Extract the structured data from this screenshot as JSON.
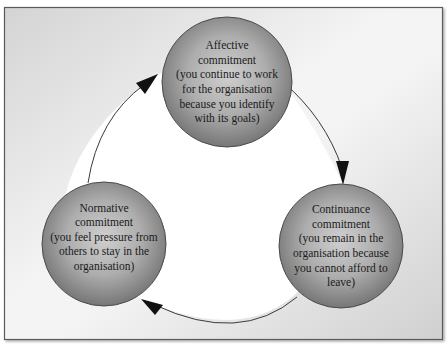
{
  "diagram": {
    "type": "cycle",
    "colors": {
      "frame_border": "#5a5a5a",
      "background_outer_light": "#ffffff",
      "background_outer_dark": "#d6d6d6",
      "inner_fill": "#ffffff",
      "circle_center": "#c4c4c4",
      "circle_edge": "#7c7c7c",
      "circle_outline": "#4a4a4a",
      "arrow": "#3a3a3a",
      "text": "#1a1a1a"
    },
    "nodes": [
      {
        "id": "affective",
        "title_line1": "Affective",
        "title_line2": "commitment",
        "desc_line1": "(you continue to work",
        "desc_line2": "for the organisation",
        "desc_line3": "because you identify",
        "desc_line4": "with its goals)"
      },
      {
        "id": "continuance",
        "title_line1": "Continuance",
        "title_line2": "commitment",
        "desc_line1": "(you remain in the",
        "desc_line2": "organisation because",
        "desc_line3": "you cannot afford to",
        "desc_line4": "leave)"
      },
      {
        "id": "normative",
        "title_line1": "Normative",
        "title_line2": "commitment",
        "desc_line1": "(you feel pressure from",
        "desc_line2": "others to stay in the",
        "desc_line3": "organisation)"
      }
    ],
    "edges": [
      {
        "from": "affective",
        "to": "continuance"
      },
      {
        "from": "continuance",
        "to": "normative"
      },
      {
        "from": "normative",
        "to": "affective"
      }
    ]
  }
}
